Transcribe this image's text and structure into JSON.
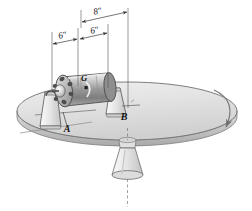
{
  "figure": {
    "background_color": "#ffffff",
    "width": 252,
    "height": 211
  },
  "dimensions": [
    {
      "id": "dim-8in",
      "label": "8\"",
      "value": 8,
      "unit": "in",
      "from": "bearing-A-plane",
      "to": "bearing-B-plane",
      "x": 98,
      "y": 14
    },
    {
      "id": "dim-6in-left",
      "label": "6\"",
      "value": 6,
      "unit": "in",
      "from": "bearing-A",
      "to": "center-of-gravity-G",
      "x": 63,
      "y": 38
    },
    {
      "id": "dim-6in-right",
      "label": "6\"",
      "value": 6,
      "unit": "in",
      "from": "center-of-gravity-G",
      "to": "right-plane",
      "x": 96,
      "y": 33
    }
  ],
  "points": [
    {
      "id": "label-G",
      "label": "G",
      "meaning": "center-of-gravity",
      "x": 84,
      "y": 81
    },
    {
      "id": "label-A",
      "label": "A",
      "meaning": "bearing-A",
      "x": 67,
      "y": 131
    },
    {
      "id": "label-B",
      "label": "B",
      "meaning": "bearing-B",
      "x": 124,
      "y": 119
    }
  ],
  "parts": {
    "disk_label": "rotating disk",
    "rotor_label": "rotor",
    "bearing_a_label": "bearing A",
    "bearing_b_label": "bearing B",
    "pedestal_label": "pedestal base",
    "spin_arrow_label": "disk rotation direction",
    "spin_axis_label": "vertical spin axis"
  },
  "colors": {
    "background": "#ffffff",
    "disk_top": "#e3e3e3",
    "disk_edge": "#c8c8c8",
    "rotor_body": "#bdbdbd",
    "rotor_dark": "#5a5a5a",
    "outline": "#4a4a4a",
    "text": "#111111"
  }
}
